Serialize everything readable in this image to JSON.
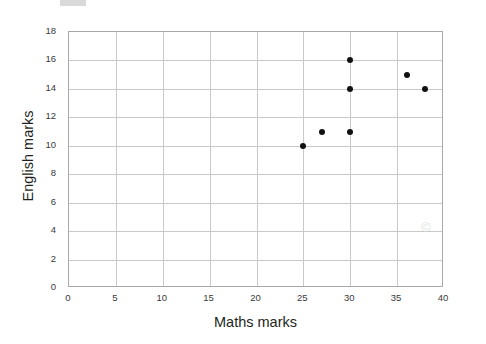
{
  "chart_data": {
    "type": "scatter",
    "title": "",
    "xlabel": "Maths marks",
    "ylabel": "English marks",
    "xlim": [
      0,
      40
    ],
    "ylim": [
      0,
      18
    ],
    "xticks": [
      0,
      5,
      10,
      15,
      20,
      25,
      30,
      35,
      40
    ],
    "yticks": [
      0,
      2,
      4,
      6,
      8,
      10,
      12,
      14,
      16,
      18
    ],
    "grid": true,
    "legend": false,
    "point_color": "#111111",
    "gridline_color": "#c9c9c9",
    "axis_color": "#a9a9a9",
    "background": "#ffffff",
    "series": [
      {
        "name": "students",
        "points": [
          {
            "x": 25,
            "y": 10
          },
          {
            "x": 27,
            "y": 11
          },
          {
            "x": 30,
            "y": 11
          },
          {
            "x": 30,
            "y": 14
          },
          {
            "x": 30,
            "y": 16
          },
          {
            "x": 36,
            "y": 15
          },
          {
            "x": 38,
            "y": 14
          }
        ]
      }
    ]
  },
  "watermark": {
    "text": "©"
  }
}
